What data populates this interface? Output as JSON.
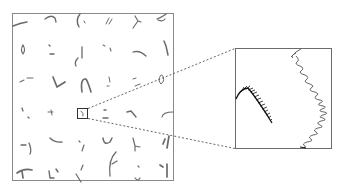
{
  "figure": {
    "overview_panel": {
      "label": "stroke-sample-grid",
      "rows": 6,
      "cols": 6,
      "frame_color": "#8a8a8a",
      "stroke_color": "#6a6a6a"
    },
    "highlight": {
      "label": "selected-sample",
      "row": 4,
      "col": 3,
      "box_color": "#333333"
    },
    "connector": {
      "style": "dashed",
      "color": "#555555"
    },
    "zoom_panel": {
      "label": "magnified-sample",
      "frame_color": "#6b6b6b",
      "contents": [
        "hatched-curved-stroke",
        "wavy-arc-stroke"
      ]
    }
  }
}
